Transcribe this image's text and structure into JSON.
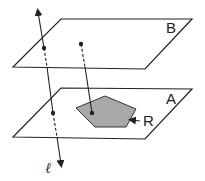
{
  "diagram": {
    "planes": [
      {
        "name": "B",
        "label": "B",
        "points": "61,19 192,19 145,69 13,67",
        "label_pos": [
          166,
          33
        ]
      },
      {
        "name": "A",
        "label": "A",
        "points": "61,88 192,89 145,139 13,137",
        "label_pos": [
          166,
          104
        ]
      }
    ],
    "region": {
      "label": "R",
      "fill": "#a8a8a8",
      "points": "76,108 105,96 136,109 126,127 95,127",
      "label_pos": [
        143,
        126
      ]
    },
    "line": {
      "label": "ℓ",
      "label_pos": [
        45,
        173
      ]
    },
    "colors": {
      "stroke": "#222222",
      "region": "#a8a8a8"
    }
  }
}
